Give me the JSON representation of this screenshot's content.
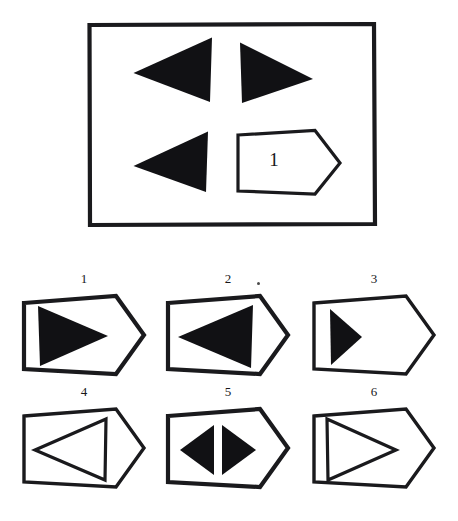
{
  "document": {
    "kind": "visual-reasoning-puzzle",
    "background_color": "#ffffff",
    "ink_color": "#111114"
  },
  "stimulus": {
    "name": "stimulus-panel",
    "frame_shape": "rectangle",
    "cells": [
      {
        "position": "top-left",
        "figure": "solid-triangle",
        "direction": "left",
        "fill": "solid",
        "label": ""
      },
      {
        "position": "top-right",
        "figure": "solid-triangle",
        "direction": "right",
        "fill": "solid",
        "label": ""
      },
      {
        "position": "bottom-left",
        "figure": "solid-triangle",
        "direction": "left",
        "fill": "solid",
        "label": ""
      },
      {
        "position": "bottom-right",
        "figure": "home-plate-pentagon",
        "direction": "right",
        "fill": "none",
        "label": "1"
      }
    ]
  },
  "options": [
    {
      "label": "1",
      "container": "home-plate-pentagon",
      "content": "solid-triangle",
      "direction": "right",
      "fill": "solid",
      "size": "large",
      "count": 1
    },
    {
      "label": "2",
      "container": "home-plate-pentagon",
      "content": "solid-triangle",
      "direction": "left",
      "fill": "solid",
      "size": "large",
      "count": 1
    },
    {
      "label": "3",
      "container": "home-plate-pentagon",
      "content": "solid-triangle",
      "direction": "right",
      "fill": "solid",
      "size": "small",
      "count": 1
    },
    {
      "label": "4",
      "container": "home-plate-pentagon",
      "content": "outline-triangle",
      "direction": "left",
      "fill": "none",
      "size": "large",
      "count": 1
    },
    {
      "label": "5",
      "container": "home-plate-pentagon",
      "content": "solid-triangle-pair",
      "direction": "left-and-right",
      "fill": "solid",
      "size": "small",
      "count": 2
    },
    {
      "label": "6",
      "container": "home-plate-pentagon",
      "content": "outline-triangle",
      "direction": "right",
      "fill": "none",
      "size": "large",
      "count": 1
    }
  ]
}
